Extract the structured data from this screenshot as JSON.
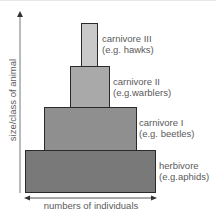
{
  "diagram": {
    "type": "ecological pyramid of numbers",
    "y_axis_label": "size/class of animal",
    "x_axis_label": "numbers of individuals",
    "levels": [
      {
        "name": "carnivore III",
        "example": "(e.g. hawks)",
        "color": "#c9c9c9"
      },
      {
        "name": "carnivore II",
        "example": "(e.g.warblers)",
        "color": "#a9a9a9"
      },
      {
        "name": "carnivore I",
        "example": "(e.g. beetles)",
        "color": "#8f8f8f"
      },
      {
        "name": "herbivore",
        "example": "(e.g.aphids)",
        "color": "#797979"
      }
    ]
  }
}
